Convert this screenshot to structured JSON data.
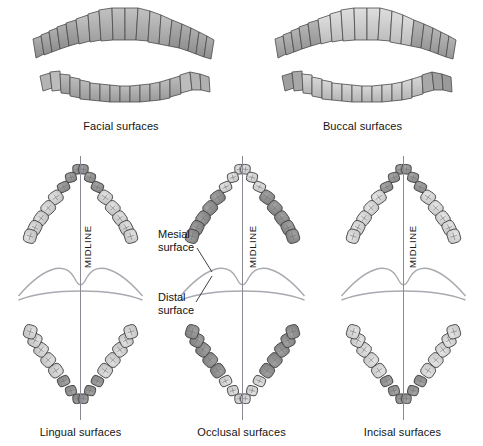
{
  "figure": {
    "background_color": "#ffffff",
    "outline_color": "#3a3a3a",
    "midline_color": "#8a8a93",
    "soft_tissue_color": "#9a9aa2"
  },
  "panels": {
    "facial": {
      "caption": "Facial surfaces",
      "view": "anterior-frontal",
      "arches": [
        "maxillary",
        "mandibular"
      ],
      "highlight_color": "#a9a9a9"
    },
    "buccal": {
      "caption": "Buccal surfaces",
      "view": "anterior-frontal",
      "arches": [
        "maxillary",
        "mandibular"
      ],
      "highlight_color": "#c9c9c9"
    },
    "lingual": {
      "caption": "Lingual surfaces",
      "view": "occlusal-both-arches",
      "highlight_color": "#8e8e8e",
      "highlighted_teeth": "anterior"
    },
    "occlusal": {
      "caption": "Occlusal surfaces",
      "view": "occlusal-both-arches",
      "highlight_color": "#7f7f7f",
      "highlighted_teeth": "posterior"
    },
    "incisal": {
      "caption": "Incisal surfaces",
      "view": "occlusal-both-arches",
      "highlight_color": "#8a8a8a",
      "highlighted_teeth": "anterior"
    }
  },
  "midline": {
    "label": "MIDLINE",
    "occurrences": 3
  },
  "annotations": {
    "mesial": {
      "line1": "Mesial",
      "line2": "surface"
    },
    "distal": {
      "line1": "Distal",
      "line2": "surface"
    }
  },
  "arch_layout": {
    "teeth_per_quadrant": 8,
    "quadrants": 4,
    "total_teeth": 32,
    "anterior_per_quadrant": 3,
    "posterior_per_quadrant": 5
  }
}
